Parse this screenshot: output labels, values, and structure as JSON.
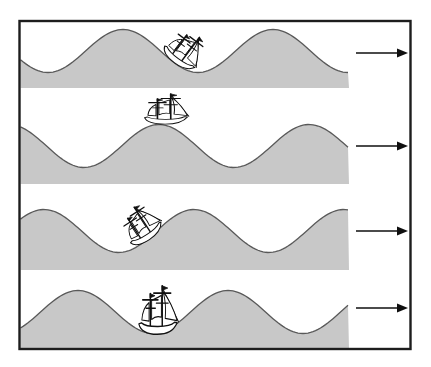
{
  "figure": {
    "name": "ship-on-travelling-wave-sequence",
    "canvas": {
      "width": 431,
      "height": 367,
      "background": "#ffffff"
    },
    "frame": {
      "x": 19.5,
      "y": 21,
      "width": 391,
      "height": 328,
      "stroke": "#1d1d1d",
      "stroke_width": 2.4,
      "fill": "#ffffff"
    },
    "wave": {
      "wavelength": 150,
      "amplitude": 21.5,
      "surface_left_x": 20.5,
      "surface_right_x": 349,
      "fill": "#c8c8c8",
      "outline": "#595959",
      "outline_width": 1.3
    },
    "arrow": {
      "color": "#0f0f0f",
      "x_start": 356,
      "x_tip": 408,
      "head_length": 11,
      "head_half_width": 4.6,
      "line_width": 1.6,
      "direction": "right"
    },
    "panels": [
      {
        "label": "snapshot-1",
        "mid_y": 51,
        "bottom_y": 88,
        "crest_x": 123,
        "arrow_y": 53,
        "ship": {
          "x": 175,
          "y": 63,
          "rotation_deg": 37,
          "scale_x": 0.82,
          "scale_y": 0.82,
          "position": "heeling-forward-on-front-slope"
        }
      },
      {
        "label": "snapshot-2",
        "mid_y": 146,
        "bottom_y": 184,
        "crest_x": 159,
        "arrow_y": 146,
        "ship": {
          "x": 166,
          "y": 124,
          "rotation_deg": 0,
          "scale_x": 0.95,
          "scale_y": 0.7,
          "position": "upright-on-crest"
        }
      },
      {
        "label": "snapshot-3",
        "mid_y": 231,
        "bottom_y": 270,
        "crest_x": 194,
        "arrow_y": 231,
        "ship": {
          "x": 150,
          "y": 239,
          "rotation_deg": -33,
          "scale_x": 0.82,
          "scale_y": 0.82,
          "position": "heeling-back-on-rear-slope"
        }
      },
      {
        "label": "snapshot-4",
        "mid_y": 312,
        "bottom_y": 349,
        "crest_x": 228,
        "arrow_y": 308,
        "ship": {
          "x": 158,
          "y": 334,
          "rotation_deg": 0,
          "scale_x": 0.85,
          "scale_y": 1.12,
          "position": "upright-in-trough"
        }
      }
    ]
  }
}
